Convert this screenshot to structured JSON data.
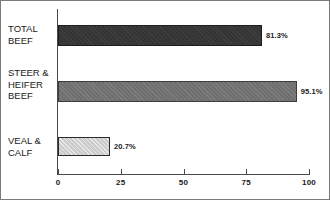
{
  "chart_data": {
    "type": "bar",
    "orientation": "horizontal",
    "title": "",
    "xlabel": "",
    "ylabel": "",
    "categories": [
      "TOTAL\nBEEF",
      "STEER &\nHEIFER\nBEEF",
      "VEAL &\nCALF"
    ],
    "values": [
      81.3,
      95.1,
      20.7
    ],
    "data_labels": [
      "81.3%",
      "95.1%",
      "20.7%"
    ],
    "xlim": [
      0,
      100
    ],
    "xticks": [
      0,
      25,
      50,
      75,
      100
    ],
    "xtick_labels": [
      "0",
      "25",
      "50",
      "75",
      "100"
    ],
    "grid": false,
    "legend": false,
    "bar_colors": [
      "#343434",
      "#6f6f6f",
      "#cbcbcb"
    ],
    "bar_edge_color": "#2b2b2b",
    "axis_color": "#4a4a4a",
    "background": "#ffffff",
    "border_color": "#7a7a7a"
  },
  "bars": [
    {
      "category": "TOTAL\nBEEF",
      "value": 81.3,
      "label": "81.3%",
      "style": "dark",
      "top": 24,
      "height": 21,
      "label_top": 30
    },
    {
      "category": "STEER &\nHEIFER\nBEEF",
      "value": 95.1,
      "label": "95.1%",
      "style": "mid",
      "top": 80,
      "height": 21,
      "label_top": 86
    },
    {
      "category": "VEAL &\nCALF",
      "value": 20.7,
      "label": "20.7%",
      "style": "light",
      "top": 136,
      "height": 19,
      "label_top": 141
    }
  ],
  "cat_labels": [
    {
      "text": "TOTAL\nBEEF",
      "top": 22
    },
    {
      "text": "STEER &\nHEIFER\nBEEF",
      "top": 66
    },
    {
      "text": "VEAL &\nCALF",
      "top": 134
    }
  ],
  "axis": {
    "ticks": [
      {
        "label": "0",
        "value": 0
      },
      {
        "label": "25",
        "value": 25
      },
      {
        "label": "50",
        "value": 50
      },
      {
        "label": "75",
        "value": 75
      },
      {
        "label": "100",
        "value": 100
      }
    ]
  }
}
